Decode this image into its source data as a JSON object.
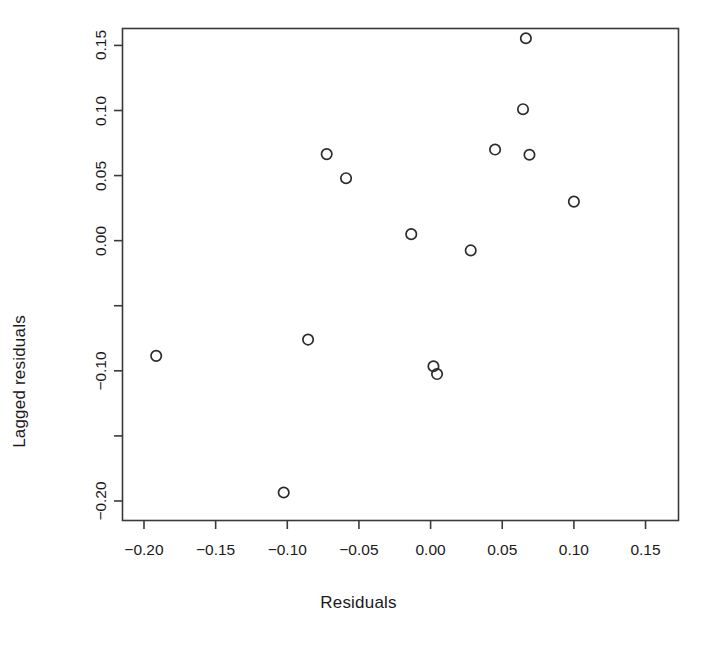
{
  "chart_data": {
    "type": "scatter",
    "title": "",
    "xlabel": "Residuals",
    "ylabel": "Lagged residuals",
    "xlim": [
      -0.215,
      0.173
    ],
    "ylim": [
      -0.215,
      0.163
    ],
    "grid": false,
    "legend": null,
    "marker": "open-circle",
    "marker_color": "#2b2b2b",
    "xticks": [
      -0.2,
      -0.15,
      -0.1,
      -0.05,
      0.0,
      0.05,
      0.1,
      0.15
    ],
    "xticklabels": [
      "-0.20",
      "-0.15",
      "-0.10",
      "-0.05",
      "0.00",
      "0.05",
      "0.10",
      "0.15"
    ],
    "yticks": [
      0.15,
      0.1,
      0.05,
      0.0,
      -0.05,
      -0.1,
      -0.15,
      -0.2
    ],
    "yticklabels": [
      "0.15",
      "0.10",
      "0.05",
      "0.00",
      "",
      "-0.10",
      "",
      "-0.20"
    ],
    "x": [
      -0.1915,
      -0.1025,
      -0.0855,
      -0.0725,
      -0.059,
      -0.0135,
      0.002,
      0.0045,
      0.028,
      0.045,
      0.0645,
      0.0665,
      0.069,
      0.1
    ],
    "y": [
      -0.0885,
      -0.1935,
      -0.076,
      0.0665,
      0.048,
      0.005,
      -0.0965,
      -0.1025,
      -0.0075,
      0.07,
      0.101,
      0.1555,
      0.066,
      0.03
    ],
    "points": [
      {
        "x": -0.1915,
        "y": -0.0885
      },
      {
        "x": -0.1025,
        "y": -0.1935
      },
      {
        "x": -0.0855,
        "y": -0.076
      },
      {
        "x": -0.0725,
        "y": 0.0665
      },
      {
        "x": -0.059,
        "y": 0.048
      },
      {
        "x": -0.0135,
        "y": 0.005
      },
      {
        "x": 0.002,
        "y": -0.0965
      },
      {
        "x": 0.0045,
        "y": -0.1025
      },
      {
        "x": 0.028,
        "y": -0.0075
      },
      {
        "x": 0.045,
        "y": 0.07
      },
      {
        "x": 0.0645,
        "y": 0.101
      },
      {
        "x": 0.0665,
        "y": 0.1555
      },
      {
        "x": 0.069,
        "y": 0.066
      },
      {
        "x": 0.1,
        "y": 0.03
      }
    ],
    "n_points": 14,
    "axis_color": "#3a3a3a",
    "background": "#ffffff"
  },
  "labels": {
    "x_axis_title": "Residuals",
    "y_axis_title": "Lagged residuals"
  }
}
